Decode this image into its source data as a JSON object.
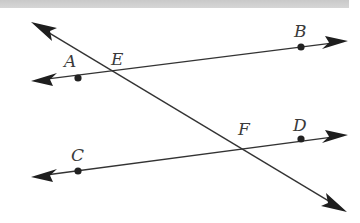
{
  "diagram": {
    "type": "geometry",
    "colors": {
      "stroke": "#333333",
      "points": "#222222",
      "labels": "#3a3a3a",
      "top_bar": "#cfcfcf"
    },
    "lines": [
      {
        "id": "line-AB",
        "from": [
          31,
          81
        ],
        "to": [
          348,
          41
        ],
        "arrows": "both"
      },
      {
        "id": "line-CD",
        "from": [
          31,
          177
        ],
        "to": [
          348,
          135
        ],
        "arrows": "both"
      },
      {
        "id": "transversal",
        "from": [
          31,
          22
        ],
        "to": [
          347,
          212
        ],
        "arrows": "both"
      }
    ],
    "points": [
      {
        "name": "A",
        "x": 78,
        "y": 78,
        "dot": true
      },
      {
        "name": "B",
        "x": 301,
        "y": 47,
        "dot": true
      },
      {
        "name": "C",
        "x": 78,
        "y": 171,
        "dot": true
      },
      {
        "name": "D",
        "x": 301,
        "y": 139,
        "dot": true
      },
      {
        "name": "E",
        "x": 114,
        "y": 73,
        "dot": false
      },
      {
        "name": "F",
        "x": 240,
        "y": 146,
        "dot": false
      }
    ],
    "labels": {
      "A": "A",
      "B": "B",
      "C": "C",
      "D": "D",
      "E": "E",
      "F": "F"
    }
  }
}
